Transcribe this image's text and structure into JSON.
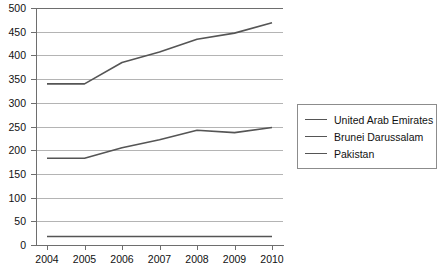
{
  "chart_data": {
    "type": "line",
    "title": "",
    "xlabel": "",
    "ylabel": "",
    "categories": [
      "2004",
      "2005",
      "2006",
      "2007",
      "2008",
      "2009",
      "2010"
    ],
    "ylim": [
      0,
      500
    ],
    "yticks": [
      "0",
      "50",
      "100",
      "150",
      "200",
      "250",
      "300",
      "350",
      "400",
      "450",
      "500"
    ],
    "grid": true,
    "legend_position": "right",
    "series": [
      {
        "name": "United Arab Emirates",
        "color": "#555555",
        "values": [
          340,
          340,
          385,
          407,
          434,
          447,
          469
        ]
      },
      {
        "name": "Brunei Darussalam",
        "color": "#555555",
        "values": [
          183,
          183,
          205,
          222,
          242,
          237,
          248
        ]
      },
      {
        "name": "Pakistan",
        "color": "#555555",
        "values": [
          18,
          18,
          18,
          18,
          18,
          18,
          18
        ]
      }
    ]
  },
  "axes": {
    "y_tick_labels": [
      "500",
      "450",
      "400",
      "350",
      "300",
      "250",
      "200",
      "150",
      "100",
      "50",
      "0"
    ],
    "x_tick_labels": [
      "2004",
      "2005",
      "2006",
      "2007",
      "2008",
      "2009",
      "2010"
    ]
  },
  "legend": {
    "entries": [
      {
        "label": "United Arab Emirates"
      },
      {
        "label": "Brunei Darussalam"
      },
      {
        "label": "Pakistan"
      }
    ]
  }
}
